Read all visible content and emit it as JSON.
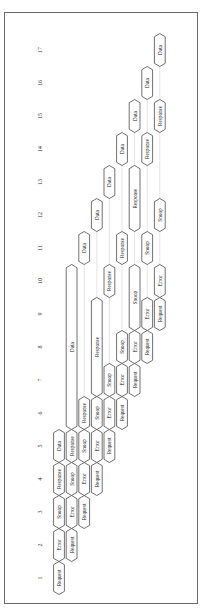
{
  "diagram": {
    "type": "pipelined-bus-transaction-timing",
    "orientation": "rotated-90",
    "time_axis": {
      "ticks": [
        1,
        2,
        3,
        4,
        5,
        6,
        7,
        8,
        9,
        10,
        11,
        12,
        13,
        14,
        15,
        16,
        17
      ]
    },
    "phase_names": [
      "Request",
      "Error",
      "Snoop",
      "Response",
      "Data"
    ],
    "transactions": [
      {
        "id": 1,
        "stages": [
          {
            "label": "Request",
            "start": 1,
            "end": 1
          },
          {
            "label": "Error",
            "start": 2,
            "end": 2
          },
          {
            "label": "Snoop",
            "start": 3,
            "end": 3
          },
          {
            "label": "Response",
            "start": 4,
            "end": 4
          },
          {
            "label": "Data",
            "start": 5,
            "end": 5
          }
        ]
      },
      {
        "id": 2,
        "stages": [
          {
            "label": "Request",
            "start": 2,
            "end": 2
          },
          {
            "label": "Error",
            "start": 3,
            "end": 3
          },
          {
            "label": "Snoop",
            "start": 4,
            "end": 4
          },
          {
            "label": "Response",
            "start": 5,
            "end": 5
          },
          {
            "label": "Data",
            "start": 6,
            "end": 10
          }
        ]
      },
      {
        "id": 3,
        "stages": [
          {
            "label": "Request",
            "start": 3,
            "end": 3
          },
          {
            "label": "Error",
            "start": 4,
            "end": 4
          },
          {
            "label": "Snoop",
            "start": 5,
            "end": 5
          },
          {
            "label": "Response",
            "start": 6,
            "end": 6
          },
          {
            "label": "Data",
            "start": 11,
            "end": 11
          }
        ]
      },
      {
        "id": 4,
        "stages": [
          {
            "label": "Request",
            "start": 4,
            "end": 4
          },
          {
            "label": "Error",
            "start": 5,
            "end": 5
          },
          {
            "label": "Snoop",
            "start": 6,
            "end": 6
          },
          {
            "label": "Response",
            "start": 7,
            "end": 9
          },
          {
            "label": "Data",
            "start": 12,
            "end": 12
          }
        ]
      },
      {
        "id": 5,
        "stages": [
          {
            "label": "Request",
            "start": 5,
            "end": 5
          },
          {
            "label": "Error",
            "start": 6,
            "end": 6
          },
          {
            "label": "Snoop",
            "start": 7,
            "end": 7
          },
          {
            "label": "Response",
            "start": 10,
            "end": 10
          },
          {
            "label": "Data",
            "start": 13,
            "end": 13
          }
        ]
      },
      {
        "id": 6,
        "stages": [
          {
            "label": "Request",
            "start": 6,
            "end": 6
          },
          {
            "label": "Error",
            "start": 7,
            "end": 7
          },
          {
            "label": "Snoop",
            "start": 8,
            "end": 8
          },
          {
            "label": "Response",
            "start": 11,
            "end": 11
          },
          {
            "label": "Data",
            "start": 14,
            "end": 14
          }
        ]
      },
      {
        "id": 7,
        "stages": [
          {
            "label": "Request",
            "start": 7,
            "end": 7
          },
          {
            "label": "Error",
            "start": 8,
            "end": 8
          },
          {
            "label": "Snoop",
            "start": 9,
            "end": 10
          },
          {
            "label": "Response",
            "start": 12,
            "end": 13
          },
          {
            "label": "Data",
            "start": 15,
            "end": 15
          }
        ]
      },
      {
        "id": 8,
        "stages": [
          {
            "label": "Request",
            "start": 8,
            "end": 8
          },
          {
            "label": "Error",
            "start": 9,
            "end": 9
          },
          {
            "label": "Snoop",
            "start": 11,
            "end": 11
          },
          {
            "label": "Response",
            "start": 14,
            "end": 14
          },
          {
            "label": "Data",
            "start": 16,
            "end": 16
          }
        ]
      },
      {
        "id": 9,
        "stages": [
          {
            "label": "Request",
            "start": 9,
            "end": 9
          },
          {
            "label": "Error",
            "start": 10,
            "end": 10
          },
          {
            "label": "Snoop",
            "start": 12,
            "end": 12
          },
          {
            "label": "Response",
            "start": 15,
            "end": 15
          },
          {
            "label": "Data",
            "start": 17,
            "end": 17
          }
        ]
      }
    ]
  },
  "colors": {
    "stroke": "#333333",
    "frame": "#6a6a6a",
    "dotted": "#999999",
    "fill": "#ffffff"
  }
}
